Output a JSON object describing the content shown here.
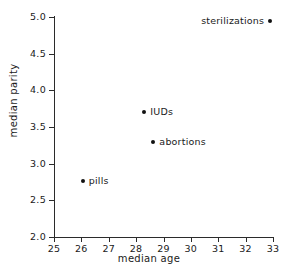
{
  "chart_data": {
    "type": "scatter",
    "title": "",
    "xlabel": "median age",
    "ylabel": "median parity",
    "xlim": [
      25,
      33
    ],
    "ylim": [
      2.0,
      5.0
    ],
    "xticks": [
      "25",
      "26",
      "27",
      "28",
      "29",
      "30",
      "31",
      "32",
      "33"
    ],
    "yticks": [
      "2.0",
      "2.5",
      "3.0",
      "3.5",
      "4.0",
      "4.5",
      "5.0"
    ],
    "grid": false,
    "legend": "none",
    "marker_color": "#111111",
    "axis_color": "#2b2b2b",
    "background": "#ffffff",
    "points": [
      {
        "label": "pills",
        "x": 26.05,
        "y": 2.77,
        "label_side": "right"
      },
      {
        "label": "IUDs",
        "x": 28.3,
        "y": 3.7,
        "label_side": "right"
      },
      {
        "label": "abortions",
        "x": 28.63,
        "y": 3.3,
        "label_side": "right"
      },
      {
        "label": "sterilizations",
        "x": 32.9,
        "y": 4.95,
        "label_side": "left"
      }
    ]
  }
}
